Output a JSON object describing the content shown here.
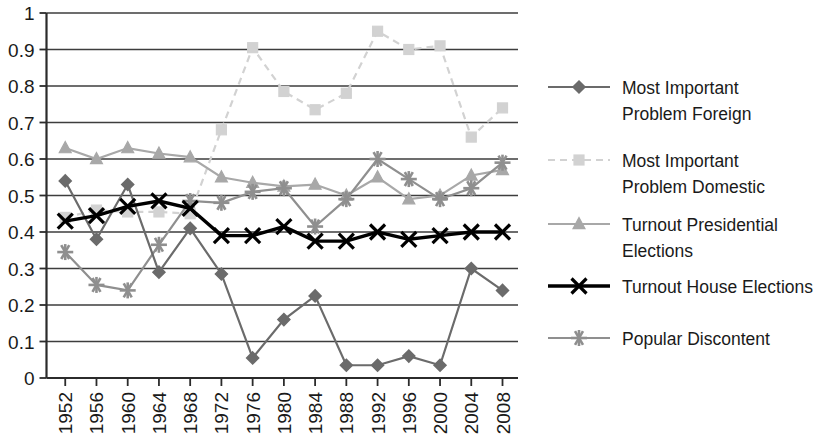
{
  "chart_data": {
    "type": "line",
    "title": "",
    "subtitle": "",
    "xlabel": "",
    "ylabel": "",
    "xlim": [
      1952,
      2008
    ],
    "ylim": [
      0,
      1
    ],
    "grid": "horizontal",
    "legend_position": "right",
    "categories": [
      "1952",
      "1956",
      "1960",
      "1964",
      "1968",
      "1972",
      "1976",
      "1980",
      "1984",
      "1988",
      "1992",
      "1996",
      "2000",
      "2004",
      "2008"
    ],
    "ytick_labels": [
      "1",
      "0.9",
      "0.8",
      "0.7",
      "0.6",
      "0.5",
      "0.4",
      "0.3",
      "0.2",
      "0.1",
      "0"
    ],
    "ytick_values": [
      1,
      0.9,
      0.8,
      0.7,
      0.6,
      0.5,
      0.4,
      0.3,
      0.2,
      0.1,
      0
    ],
    "series": [
      {
        "name": "Most Important Problem Foreign",
        "marker": "diamond",
        "color": "#6b6b6b",
        "line_style": "solid",
        "values": [
          0.54,
          0.38,
          0.53,
          0.29,
          0.41,
          0.285,
          0.055,
          0.16,
          0.225,
          0.035,
          0.035,
          0.06,
          0.035,
          0.3,
          0.24
        ]
      },
      {
        "name": "Most Important Problem Domestic",
        "marker": "square",
        "color": "#d2d2d2",
        "line_style": "dashed",
        "values": [
          0.44,
          0.46,
          0.455,
          0.455,
          0.45,
          0.68,
          0.905,
          0.785,
          0.735,
          0.78,
          0.95,
          0.9,
          0.91,
          0.66,
          0.74
        ]
      },
      {
        "name": "Turnout Presidential Elections",
        "marker": "triangle",
        "color": "#a8a8a8",
        "line_style": "solid",
        "values": [
          0.63,
          0.6,
          0.63,
          0.615,
          0.605,
          0.55,
          0.535,
          0.525,
          0.53,
          0.5,
          0.55,
          0.49,
          0.5,
          0.555,
          0.57
        ]
      },
      {
        "name": "Turnout House Elections",
        "marker": "x",
        "color": "#000000",
        "line_style": "solid",
        "values": [
          0.43,
          0.445,
          0.47,
          0.485,
          0.465,
          0.39,
          0.39,
          0.415,
          0.375,
          0.375,
          0.4,
          0.38,
          0.39,
          0.4,
          0.4
        ]
      },
      {
        "name": "Popular Discontent",
        "marker": "asterisk",
        "color": "#8f8f8f",
        "line_style": "solid",
        "values": [
          0.345,
          0.255,
          0.24,
          0.365,
          0.485,
          0.48,
          0.51,
          0.52,
          0.415,
          0.49,
          0.6,
          0.545,
          0.49,
          0.52,
          0.59
        ]
      }
    ]
  },
  "legend": {
    "items": [
      {
        "label_line1": "Most Important",
        "label_line2": "Problem Foreign"
      },
      {
        "label_line1": "Most Important",
        "label_line2": "Problem Domestic"
      },
      {
        "label_line1": "Turnout Presidential",
        "label_line2": "Elections"
      },
      {
        "label_line1": "Turnout House Elections",
        "label_line2": ""
      },
      {
        "label_line1": "Popular Discontent",
        "label_line2": ""
      }
    ]
  }
}
